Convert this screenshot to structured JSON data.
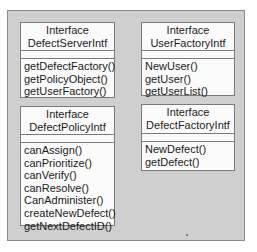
{
  "diagram": {
    "type": "uml-class-interfaces",
    "boxes": [
      {
        "stereotype": "Interface",
        "name": "DefectServerIntf",
        "methods": [
          "getDefectFactory()",
          "getPolicyObject()",
          "getUserFactory()"
        ]
      },
      {
        "stereotype": "Interface",
        "name": "UserFactoryIntf",
        "methods": [
          "NewUser()",
          "getUser()",
          "getUserList()"
        ]
      },
      {
        "stereotype": "Interface",
        "name": "DefectPolicyIntf",
        "methods": [
          "canAssign()",
          "canPrioritize()",
          "canVerify()",
          "canResolve()",
          "CanAdminister()",
          "createNewDefect()",
          "getNextDefectID()"
        ]
      },
      {
        "stereotype": "Interface",
        "name": "DefectFactoryIntf",
        "methods": [
          "NewDefect()",
          "getDefect()"
        ]
      }
    ]
  }
}
